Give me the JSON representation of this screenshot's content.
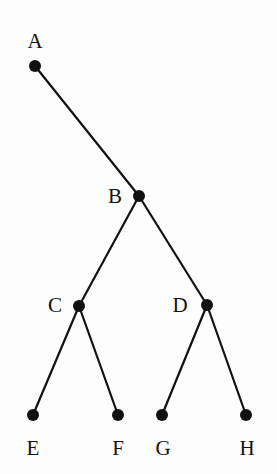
{
  "figure": {
    "width": 277,
    "height": 474,
    "background_color": "#fdfdfd",
    "stroke_color": "#111111",
    "node_fill_color": "#111111",
    "node_radius": 6,
    "edge_width": 2.2,
    "label_font_size": 21
  },
  "chart_data": {
    "type": "diagram",
    "subtype": "rooted-tree",
    "root": "A",
    "nodes": [
      {
        "id": "A",
        "label": "A",
        "x": 35,
        "y": 66,
        "label_x": 35,
        "label_y": 41,
        "depth": 0
      },
      {
        "id": "B",
        "label": "B",
        "x": 139,
        "y": 196,
        "label_x": 115,
        "label_y": 196,
        "depth": 1
      },
      {
        "id": "C",
        "label": "C",
        "x": 79,
        "y": 306,
        "label_x": 55,
        "label_y": 305,
        "depth": 2
      },
      {
        "id": "D",
        "label": "D",
        "x": 207,
        "y": 305,
        "label_x": 180,
        "label_y": 305,
        "depth": 2
      },
      {
        "id": "E",
        "label": "E",
        "x": 33,
        "y": 415,
        "label_x": 33,
        "label_y": 448,
        "depth": 3
      },
      {
        "id": "F",
        "label": "F",
        "x": 118,
        "y": 415,
        "label_x": 118,
        "label_y": 448,
        "depth": 3
      },
      {
        "id": "G",
        "label": "G",
        "x": 162,
        "y": 415,
        "label_x": 163,
        "label_y": 448,
        "depth": 3
      },
      {
        "id": "H",
        "label": "H",
        "x": 246,
        "y": 415,
        "label_x": 247,
        "label_y": 448,
        "depth": 3
      }
    ],
    "edges": [
      {
        "from": "A",
        "to": "B"
      },
      {
        "from": "B",
        "to": "C"
      },
      {
        "from": "B",
        "to": "D"
      },
      {
        "from": "C",
        "to": "E"
      },
      {
        "from": "C",
        "to": "F"
      },
      {
        "from": "D",
        "to": "G"
      },
      {
        "from": "D",
        "to": "H"
      }
    ],
    "leaves": [
      "E",
      "F",
      "G",
      "H"
    ],
    "xlabel": "",
    "ylabel": "",
    "legend": []
  }
}
